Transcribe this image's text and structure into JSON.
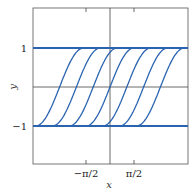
{
  "chart_data": {
    "type": "line",
    "title": "",
    "xlabel": "x",
    "ylabel": "y",
    "xlim": [
      -3.3,
      3.3
    ],
    "ylim": [
      -2,
      2
    ],
    "xticks": [
      {
        "value": -1.5708,
        "label": "−π/2"
      },
      {
        "value": 1.5708,
        "label": "π/2"
      }
    ],
    "yticks": [
      {
        "value": 1,
        "label": "1"
      },
      {
        "value": -1,
        "label": "−1"
      }
    ],
    "grid": false,
    "axes_lines": {
      "x_axis_at": 0,
      "y_axis_at": 0
    },
    "series": [
      {
        "name": "equilibrium y=1",
        "type": "hline",
        "value": 1
      },
      {
        "name": "equilibrium y=-1",
        "type": "hline",
        "value": -1
      },
      {
        "name": "curve shift -3",
        "shift": -3.3
      },
      {
        "name": "curve shift -2",
        "shift": -2.2
      },
      {
        "name": "curve shift -1",
        "shift": -1.1
      },
      {
        "name": "curve shift 0",
        "shift": 0
      },
      {
        "name": "curve shift 1",
        "shift": 1.1
      },
      {
        "name": "curve shift 2",
        "shift": 2.2
      },
      {
        "name": "curve shift 3",
        "shift": 3.3
      }
    ],
    "line_color": "#2a63b0"
  },
  "labels": {
    "xlabel": "x",
    "ylabel": "y",
    "ytick_top": "1",
    "ytick_bottom": "−1",
    "xtick_left": "−π/2",
    "xtick_right": "π/2"
  }
}
